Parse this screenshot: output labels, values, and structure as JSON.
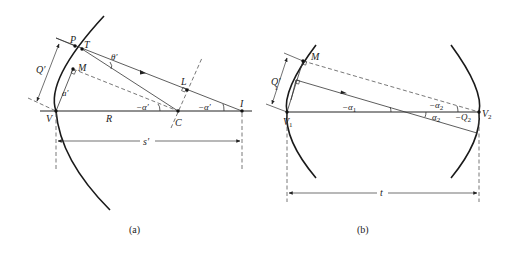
{
  "figure": {
    "panel_a": {
      "caption": "(a)",
      "points": {
        "P": "P",
        "T": "T",
        "M": "M",
        "V": "V",
        "C": "C",
        "L": "L",
        "I": "I"
      },
      "labels": {
        "Q_prime": "Q′",
        "a_prime": "a′",
        "theta_prime": "θ′",
        "R": "R",
        "neg_alpha_prime_C": "−α′",
        "neg_alpha_prime_I": "−α′",
        "s_prime": "s′"
      }
    },
    "panel_b": {
      "caption": "(b)",
      "points": {
        "M": "M",
        "V1": "V",
        "V1_sub": "1",
        "V2": "V",
        "V2_sub": "2"
      },
      "labels": {
        "Q1_prime": "Q′",
        "Q1_sub": "1",
        "neg_alpha1": "−α",
        "neg_alpha1_sub": "1",
        "neg_alpha2_top": "−α",
        "neg_alpha2_top_sub": "2",
        "alpha2_bottom": "α",
        "alpha2_bottom_sub": "2",
        "neg_Q2": "−Q",
        "neg_Q2_sub": "2",
        "t": "t"
      }
    }
  }
}
